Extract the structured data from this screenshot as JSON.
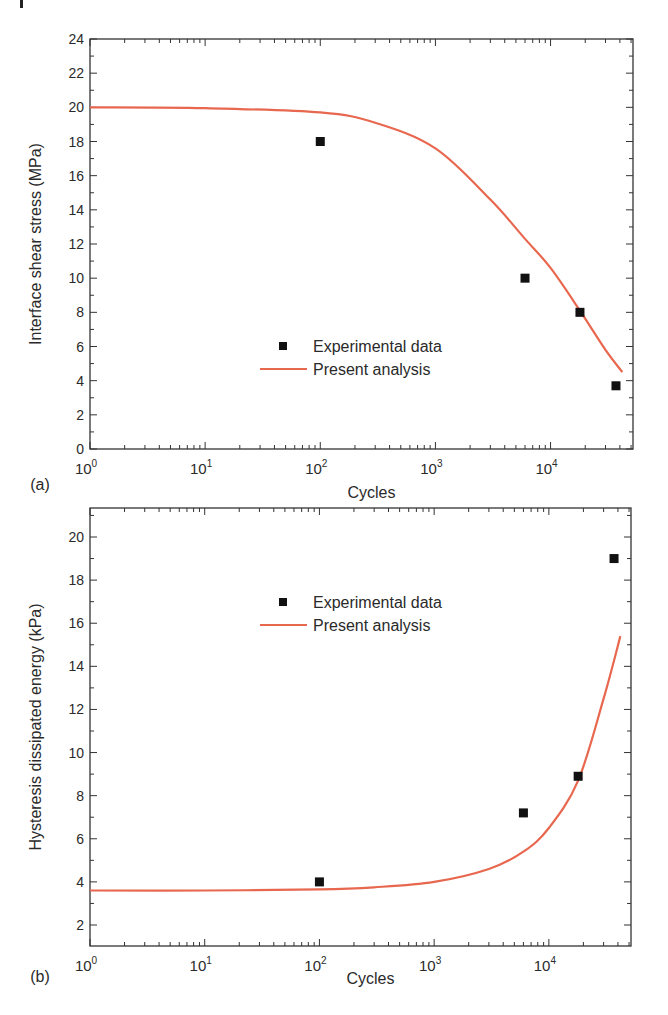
{
  "figure": {
    "panels": [
      "(a)",
      "(b)"
    ]
  },
  "legend": {
    "experimental": "Experimental data",
    "analysis": "Present analysis"
  },
  "colors": {
    "curve": "#e8674f",
    "marker": "#111111",
    "axis": "#333333"
  },
  "chart_data": [
    {
      "panel": "(a)",
      "type": "scatter",
      "title": "",
      "xlabel": "Cycles",
      "ylabel": "Interface shear stress (MPa)",
      "xscale": "log",
      "xlim": [
        1,
        52000
      ],
      "ylim": [
        0,
        24
      ],
      "x_ticks": [
        "10^0",
        "10^1",
        "10^2",
        "10^3",
        "10^4"
      ],
      "y_ticks": [
        0,
        2,
        4,
        6,
        8,
        10,
        12,
        14,
        16,
        18,
        20,
        22,
        24
      ],
      "grid": false,
      "legend_position": "center-right",
      "series": [
        {
          "name": "Experimental data",
          "kind": "scatter",
          "marker": "square",
          "x": [
            100,
            6000,
            18000,
            37000
          ],
          "y": [
            18.0,
            10.0,
            8.0,
            3.7
          ]
        },
        {
          "name": "Present analysis",
          "kind": "line",
          "x": [
            1,
            10,
            100,
            300,
            1000,
            3000,
            6000,
            10000,
            18000,
            30000,
            42000
          ],
          "y": [
            20.0,
            19.95,
            19.7,
            19.1,
            17.6,
            14.6,
            12.3,
            10.6,
            8.1,
            5.8,
            4.5
          ]
        }
      ]
    },
    {
      "panel": "(b)",
      "type": "scatter",
      "title": "",
      "xlabel": "Cycles",
      "ylabel": "Hysteresis dissipated energy (kPa)",
      "xscale": "log",
      "xlim": [
        1,
        52000
      ],
      "ylim": [
        2,
        21
      ],
      "x_ticks": [
        "10^0",
        "10^1",
        "10^2",
        "10^3",
        "10^4"
      ],
      "y_ticks": [
        2,
        4,
        6,
        8,
        10,
        12,
        14,
        16,
        18,
        20
      ],
      "grid": false,
      "legend_position": "upper-center",
      "series": [
        {
          "name": "Experimental data",
          "kind": "scatter",
          "marker": "square",
          "x": [
            100,
            6000,
            18000,
            37000
          ],
          "y": [
            4.0,
            7.2,
            8.9,
            19.0
          ]
        },
        {
          "name": "Present analysis",
          "kind": "line",
          "x": [
            1,
            10,
            100,
            300,
            1000,
            3000,
            6000,
            10000,
            18000,
            30000,
            42000
          ],
          "y": [
            3.6,
            3.6,
            3.65,
            3.75,
            4.0,
            4.6,
            5.4,
            6.5,
            8.7,
            12.5,
            15.4
          ]
        }
      ]
    }
  ]
}
